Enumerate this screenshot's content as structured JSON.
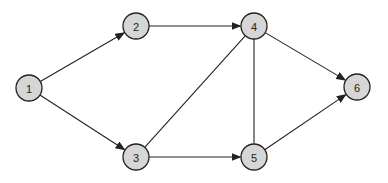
{
  "diagram": {
    "type": "directed-graph",
    "node_radius": 13,
    "colors": {
      "node_fill": "#d6d6d6",
      "stroke": "#222222",
      "background": "#ffffff"
    },
    "nodes": [
      {
        "id": "1",
        "label": "1",
        "x": 29,
        "y": 88
      },
      {
        "id": "2",
        "label": "2",
        "x": 136,
        "y": 26
      },
      {
        "id": "3",
        "label": "3",
        "x": 136,
        "y": 157
      },
      {
        "id": "4",
        "label": "4",
        "x": 254,
        "y": 26
      },
      {
        "id": "5",
        "label": "5",
        "x": 254,
        "y": 157
      },
      {
        "id": "6",
        "label": "6",
        "x": 357,
        "y": 87
      }
    ],
    "edges": [
      {
        "from": "1",
        "to": "2",
        "directed": true
      },
      {
        "from": "1",
        "to": "3",
        "directed": true
      },
      {
        "from": "2",
        "to": "4",
        "directed": true
      },
      {
        "from": "3",
        "to": "4",
        "directed": false
      },
      {
        "from": "3",
        "to": "5",
        "directed": true
      },
      {
        "from": "4",
        "to": "5",
        "directed": false
      },
      {
        "from": "4",
        "to": "6",
        "directed": true
      },
      {
        "from": "5",
        "to": "6",
        "directed": true
      }
    ]
  }
}
